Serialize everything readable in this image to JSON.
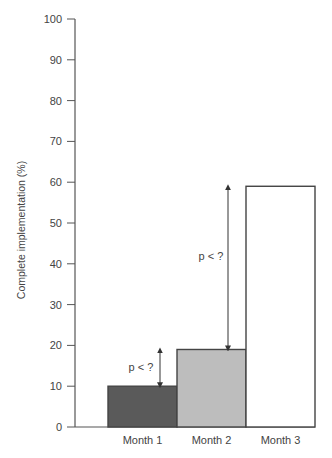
{
  "chart_data": {
    "type": "bar",
    "title": "",
    "xlabel": "",
    "ylabel": "Complete implementation (%)",
    "categories": [
      "Month 1",
      "Month 2",
      "Month 3"
    ],
    "values": [
      10,
      19,
      59
    ],
    "bar_colors": [
      "#5a5a5a",
      "#bdbdbd",
      "#ffffff"
    ],
    "ylim": [
      0,
      100
    ],
    "yticks": [
      0,
      10,
      20,
      30,
      40,
      50,
      60,
      70,
      80,
      90,
      100
    ],
    "grid": false,
    "legend": null,
    "annotations": [
      {
        "label": "p < ?",
        "from_category": "Month 1",
        "to_category": "Month 2",
        "from_value": 10,
        "to_value": 19
      },
      {
        "label": "p < ?",
        "from_category": "Month 2",
        "to_category": "Month 3",
        "from_value": 19,
        "to_value": 59
      }
    ]
  }
}
